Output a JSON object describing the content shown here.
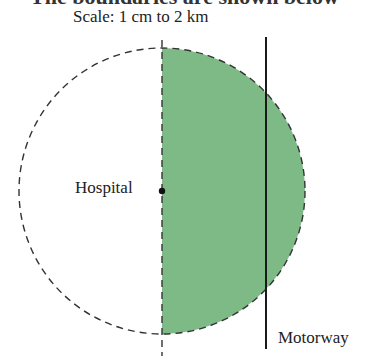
{
  "heading_partial": "The boundaries are shown below",
  "scale_label": "Scale: 1 cm to 2 km",
  "labels": {
    "hospital": "Hospital",
    "motorway": "Motorway"
  },
  "colors": {
    "region_fill": "#7dba86",
    "line": "#1a1a1a",
    "dashed": "#333333"
  },
  "geometry": {
    "circle_center": [
      162,
      191
    ],
    "circle_radius": 143,
    "motorway_x": 266
  }
}
